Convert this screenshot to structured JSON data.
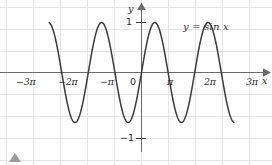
{
  "figure": {
    "title": "",
    "background_color": "#ffffff",
    "grid_color": "#e4e4e6",
    "axis_color": "#6b6b6b",
    "curve_color": "#3a3a3a",
    "text_color": "#2b2b2b",
    "marker_color": "#9a9a9a",
    "marker_name": "triangle-marker"
  },
  "chart_data": {
    "type": "line",
    "title": "",
    "subtitle": "",
    "xlabel": "x",
    "ylabel": "y",
    "equation": "y = sin x",
    "function": "sin",
    "amplitude": 1,
    "period": "2π",
    "xlim": [
      -10.9,
      10.9
    ],
    "ylim": [
      -1.55,
      1.55
    ],
    "grid": true,
    "legend": "none",
    "origin_label": "0",
    "x_ticks": [
      {
        "value": -9.42478,
        "label": "−3π"
      },
      {
        "value": -6.28319,
        "label": "−2π"
      },
      {
        "value": -3.14159,
        "label": "−π"
      },
      {
        "value": 3.14159,
        "label": "π"
      },
      {
        "value": 6.28319,
        "label": "2π"
      },
      {
        "value": 9.42478,
        "label": "3π"
      }
    ],
    "y_ticks": [
      {
        "value": 1,
        "label": "1"
      },
      {
        "value": -1,
        "label": "−1"
      }
    ],
    "key_points": {
      "maxima_x": [
        "−5π/2",
        "−3π/2 ",
        "π/2",
        "5π/2"
      ],
      "minima_x": [
        "−7π/2",
        "−π/2",
        "3π/2",
        "7π/2"
      ],
      "zeros_x": [
        "−3π",
        "−2π",
        "−π",
        "0",
        "π",
        "2π",
        "3π"
      ],
      "max_value": 1,
      "min_value": -1
    },
    "x_values_sampled": [
      -10.9,
      -10.6,
      -10.3,
      -10.0,
      -9.7,
      -9.42478,
      -9.1,
      -8.8,
      -8.5,
      -8.2,
      -7.854,
      -7.5,
      -7.2,
      -6.9,
      -6.6,
      -6.28319,
      -6.0,
      -5.7,
      -5.4,
      -5.1,
      -4.712,
      -4.4,
      -4.1,
      -3.8,
      -3.5,
      -3.14159,
      -2.8,
      -2.5,
      -2.2,
      -1.9,
      -1.571,
      -1.2,
      -0.9,
      -0.6,
      -0.3,
      0,
      0.3,
      0.6,
      0.9,
      1.2,
      1.571,
      1.9,
      2.2,
      2.5,
      2.8,
      3.14159,
      3.5,
      3.8,
      4.1,
      4.4,
      4.712,
      5.1,
      5.4,
      5.7,
      6.0,
      6.28319,
      6.6,
      6.9,
      7.2,
      7.5,
      7.854,
      8.2,
      8.5,
      8.8,
      9.1,
      9.42478,
      9.7,
      10.0,
      10.3,
      10.6,
      10.9
    ],
    "y_values_sampled": [
      0.995,
      0.935,
      0.739,
      0.544,
      0.262,
      0.0,
      -0.292,
      -0.572,
      -0.798,
      -0.942,
      -1.0,
      -0.938,
      -0.793,
      -0.571,
      -0.311,
      0.0,
      0.279,
      0.551,
      0.773,
      0.926,
      1.0,
      0.952,
      0.818,
      0.612,
      0.351,
      0.0,
      -0.335,
      -0.599,
      -0.808,
      -0.946,
      -1.0,
      -0.932,
      -0.783,
      -0.565,
      -0.296,
      0.0,
      0.296,
      0.565,
      0.783,
      0.932,
      1.0,
      0.946,
      0.808,
      0.599,
      0.335,
      0.0,
      -0.351,
      -0.612,
      -0.818,
      -0.952,
      -1.0,
      -0.926,
      -0.773,
      -0.551,
      -0.279,
      0.0,
      0.311,
      0.571,
      0.793,
      0.938,
      1.0,
      0.942,
      0.798,
      0.572,
      0.292,
      0.0,
      -0.262,
      -0.544,
      -0.739,
      -0.935,
      -0.995
    ]
  },
  "labels": {
    "y_axis": "y",
    "x_axis": "x",
    "origin": "0",
    "y_one": "1",
    "y_minus_one": "−1",
    "equation": "y = sin x",
    "tick_minus_3pi": "−3π",
    "tick_minus_2pi": "−2π",
    "tick_minus_pi": "−π",
    "tick_pi": "π",
    "tick_2pi": "2π",
    "tick_3pi": "3π"
  }
}
